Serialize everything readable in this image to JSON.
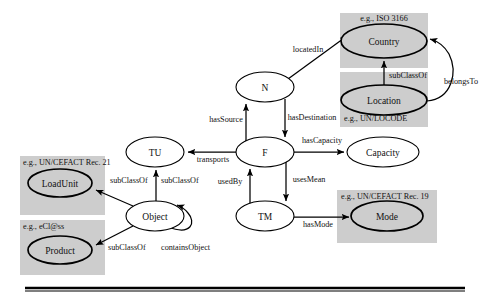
{
  "diagram": {
    "background": "#ffffff",
    "shade_color": "#cdcdcd",
    "nodes": [
      {
        "id": "country",
        "label": "Country",
        "cx": 384,
        "cy": 41,
        "rx": 43,
        "ry": 17,
        "style": "emph"
      },
      {
        "id": "location",
        "label": "Location",
        "cx": 384,
        "cy": 100,
        "rx": 43,
        "ry": 15,
        "style": "emph"
      },
      {
        "id": "n",
        "label": "N",
        "cx": 265,
        "cy": 87,
        "rx": 29,
        "ry": 15,
        "style": "plain"
      },
      {
        "id": "f",
        "label": "F",
        "cx": 265,
        "cy": 152,
        "rx": 29,
        "ry": 15,
        "style": "plain"
      },
      {
        "id": "tu",
        "label": "TU",
        "cx": 155,
        "cy": 152,
        "rx": 29,
        "ry": 15,
        "style": "plain"
      },
      {
        "id": "tm",
        "label": "TM",
        "cx": 265,
        "cy": 216,
        "rx": 29,
        "ry": 15,
        "style": "plain"
      },
      {
        "id": "capacity",
        "label": "Capacity",
        "cx": 383,
        "cy": 152,
        "rx": 36,
        "ry": 15,
        "style": "plain"
      },
      {
        "id": "mode",
        "label": "Mode",
        "cx": 387,
        "cy": 216,
        "rx": 36,
        "ry": 15,
        "style": "emph"
      },
      {
        "id": "object",
        "label": "Object",
        "cx": 155,
        "cy": 216,
        "rx": 29,
        "ry": 15,
        "style": "plain"
      },
      {
        "id": "loadunit",
        "label": "LoadUnit",
        "cx": 60,
        "cy": 183,
        "rx": 32,
        "ry": 14,
        "style": "emph"
      },
      {
        "id": "product",
        "label": "Product",
        "cx": 60,
        "cy": 250,
        "rx": 32,
        "ry": 14,
        "style": "emph"
      }
    ],
    "shaded_boxes": [
      {
        "id": "box-country",
        "x": 340,
        "y": 13,
        "w": 88,
        "h": 55,
        "caption": "e.g., ISO 3166",
        "caption_x": 384,
        "caption_y": 21,
        "caption_anchor": "middle"
      },
      {
        "id": "box-location",
        "x": 340,
        "y": 72,
        "w": 88,
        "h": 55,
        "caption": "e.g., UN/LOCODE",
        "caption_x": 344,
        "caption_y": 121,
        "caption_anchor": "start"
      },
      {
        "id": "box-mode",
        "x": 337,
        "y": 190,
        "w": 100,
        "h": 53,
        "caption": "e.g., UN/CEFACT Rec. 19",
        "caption_x": 341,
        "caption_y": 199,
        "caption_anchor": "start"
      },
      {
        "id": "box-loadunit",
        "x": 20,
        "y": 156,
        "w": 85,
        "h": 59,
        "caption": "e.g., UN/CEFACT Rec. 21",
        "caption_x": 23,
        "caption_y": 165,
        "caption_anchor": "start"
      },
      {
        "id": "box-product",
        "x": 20,
        "y": 220,
        "w": 85,
        "h": 55,
        "caption": "e.g., eCl@ss",
        "caption_x": 23,
        "caption_y": 229,
        "caption_anchor": "start"
      }
    ],
    "edges": [
      {
        "id": "locatedIn",
        "label": "locatedIn",
        "from": "n",
        "to": "country",
        "lx": 308,
        "ly": 52,
        "anchor": "middle"
      },
      {
        "id": "subClassOf-loc",
        "label": "subClassOf",
        "from": "location",
        "to": "country",
        "lx": 408,
        "ly": 78,
        "anchor": "middle"
      },
      {
        "id": "belongsTo",
        "label": "belongsTo",
        "from": "location",
        "to": "country",
        "lx": 461,
        "ly": 84,
        "anchor": "middle"
      },
      {
        "id": "hasSource",
        "label": "hasSource",
        "from": "f",
        "to": "n",
        "lx": 226,
        "ly": 122,
        "anchor": "middle"
      },
      {
        "id": "hasDestination",
        "label": "hasDestination",
        "from": "n",
        "to": "f",
        "lx": 312,
        "ly": 120,
        "anchor": "middle"
      },
      {
        "id": "hasCapacity",
        "label": "hasCapacity",
        "from": "f",
        "to": "capacity",
        "lx": 322,
        "ly": 143,
        "anchor": "middle"
      },
      {
        "id": "transports",
        "label": "transports",
        "from": "f",
        "to": "tu",
        "lx": 213,
        "ly": 162,
        "anchor": "middle"
      },
      {
        "id": "usedBy",
        "label": "usedBy",
        "from": "tm",
        "to": "f",
        "lx": 230,
        "ly": 184,
        "anchor": "middle"
      },
      {
        "id": "usesMean",
        "label": "usesMean",
        "from": "f",
        "to": "tm",
        "lx": 309,
        "ly": 182,
        "anchor": "middle"
      },
      {
        "id": "hasMode",
        "label": "hasMode",
        "from": "tm",
        "to": "mode",
        "lx": 318,
        "ly": 227,
        "anchor": "middle"
      },
      {
        "id": "subClassOf-tu",
        "label": "subClassOf",
        "from": "object",
        "to": "tu",
        "lx": 172,
        "ly": 183,
        "anchor": "start"
      },
      {
        "id": "subClassOf-lu",
        "label": "subClassOf",
        "from": "object",
        "to": "loadunit",
        "lx": 118,
        "ly": 183,
        "anchor": "start"
      },
      {
        "id": "subClassOf-pr",
        "label": "subClassOf",
        "from": "object",
        "to": "product",
        "lx": 113,
        "ly": 249,
        "anchor": "start"
      },
      {
        "id": "containsObject",
        "label": "containsObject",
        "from": "object",
        "to": "object",
        "lx": 172,
        "ly": 249,
        "anchor": "start"
      }
    ],
    "footer_rule": {
      "x1": 25,
      "x2": 465,
      "y": 288
    }
  }
}
